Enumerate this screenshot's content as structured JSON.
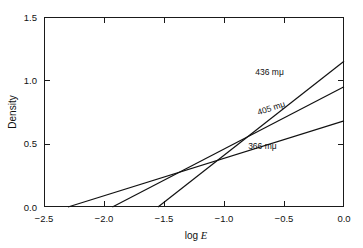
{
  "chart_data": {
    "type": "line",
    "title": "",
    "xlabel": "log E",
    "ylabel": "Density",
    "xlim": [
      -2.5,
      0.0
    ],
    "ylim": [
      0.0,
      1.5
    ],
    "xticks": [
      -2.5,
      -2.0,
      -1.5,
      -1.0,
      -0.5,
      0.0
    ],
    "xticklabels": [
      "−2.5",
      "−2.0",
      "−1.5",
      "−1.0",
      "−0.5",
      "0.0"
    ],
    "yticks": [
      0.0,
      0.5,
      1.0,
      1.5
    ],
    "yticklabels": [
      "0.0",
      "0.5",
      "1.0",
      "1.5"
    ],
    "grid": false,
    "legend_position": "inline-annotations",
    "line_color": "#111111",
    "axis_color": "#1a1a1a",
    "background": "#ffffff",
    "series": [
      {
        "name": "436 mμ",
        "label": "436 mμ",
        "x": [
          -1.55,
          0.0
        ],
        "y": [
          0.0,
          1.15
        ],
        "x_intercept": -1.55,
        "slope": 0.742,
        "label_x": -0.62,
        "label_y": 1.04,
        "label_rotation": 0
      },
      {
        "name": "405 mμ",
        "label": "405 mμ",
        "x": [
          -1.93,
          0.0
        ],
        "y": [
          0.0,
          0.95
        ],
        "x_intercept": -1.93,
        "slope": 0.492,
        "label_x": -0.6,
        "label_y": 0.76,
        "label_rotation": -18
      },
      {
        "name": "366 mμ",
        "label": "366 mμ",
        "x": [
          -2.3,
          0.0
        ],
        "y": [
          0.0,
          0.68
        ],
        "x_intercept": -2.3,
        "slope": 0.296,
        "label_x": -0.68,
        "label_y": 0.46,
        "label_rotation": 0
      }
    ]
  }
}
